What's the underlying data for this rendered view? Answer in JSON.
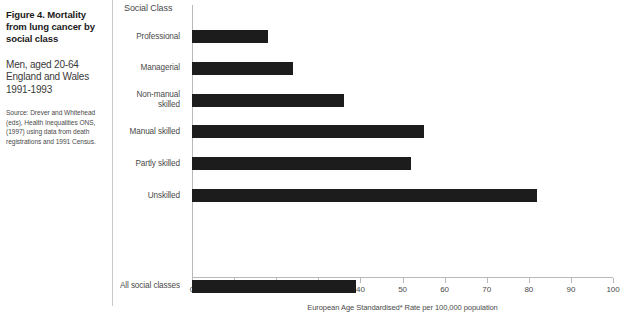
{
  "caption": {
    "title": "Figure 4.\nMortality from lung cancer by social class",
    "subtitle": "Men, aged 20-64\nEngland and Wales\n1991-1993",
    "source": "Source: Drever and Whitehead (eds), Health Inequalities ONS, (1997) using data from death registrations and 1991 Census."
  },
  "chart_header": "Social Class",
  "colors": {
    "bar": "#1c1c1c",
    "axis": "#b9b9b9",
    "text": "#4a4a4a",
    "title": "#1a1a1a",
    "divider": "#c9c9c9"
  },
  "chart_data": {
    "type": "bar",
    "orientation": "horizontal",
    "title": "Mortality from lung cancer by social class",
    "xlabel": "European Age Standardised* Rate per 100,000 population",
    "ylabel": "Social Class",
    "xlim": [
      0,
      100
    ],
    "xticks": [
      0,
      10,
      20,
      30,
      40,
      50,
      60,
      70,
      80,
      90,
      100
    ],
    "grid": false,
    "legend": false,
    "categories": [
      "Professional",
      "Managerial",
      "Non-manual\nskilled",
      "Manual skilled",
      "Partly skilled",
      "Unskilled",
      "All social classes"
    ],
    "values": [
      18,
      24,
      36,
      55,
      52,
      82,
      39
    ]
  }
}
